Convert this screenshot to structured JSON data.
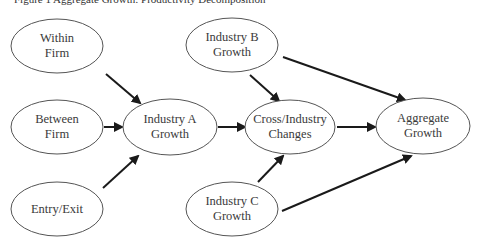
{
  "caption": "Figure 1  Aggregate Growth: Productivity Decomposition",
  "colors": {
    "background": "#ffffff",
    "node_stroke": "#555555",
    "edge": "#1a1a1a",
    "text": "#3a3a3a"
  },
  "nodes": {
    "within_firm": {
      "line1": "Within",
      "line2": "Firm"
    },
    "between_firm": {
      "line1": "Between",
      "line2": "Firm"
    },
    "entry_exit": {
      "line1": "Entry/Exit"
    },
    "industry_a": {
      "line1": "Industry A",
      "line2": "Growth"
    },
    "industry_b": {
      "line1": "Industry B",
      "line2": "Growth"
    },
    "industry_c": {
      "line1": "Industry C",
      "line2": "Growth"
    },
    "cross_industry": {
      "line1": "Cross/Industry",
      "line2": "Changes"
    },
    "aggregate": {
      "line1": "Aggregate",
      "line2": "Growth"
    }
  },
  "edges": [
    {
      "from": "Within Firm",
      "to": "Industry A Growth"
    },
    {
      "from": "Between Firm",
      "to": "Industry A Growth"
    },
    {
      "from": "Entry/Exit",
      "to": "Industry A Growth"
    },
    {
      "from": "Industry A Growth",
      "to": "Cross/Industry Changes"
    },
    {
      "from": "Industry B Growth",
      "to": "Cross/Industry Changes"
    },
    {
      "from": "Industry C Growth",
      "to": "Cross/Industry Changes"
    },
    {
      "from": "Industry B Growth",
      "to": "Aggregate Growth"
    },
    {
      "from": "Cross/Industry Changes",
      "to": "Aggregate Growth"
    },
    {
      "from": "Industry C Growth",
      "to": "Aggregate Growth"
    }
  ]
}
